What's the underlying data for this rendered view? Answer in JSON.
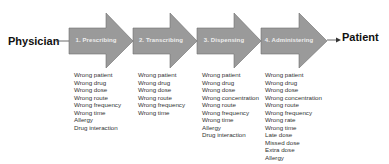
{
  "diagram": {
    "source": "Physician",
    "target": "Patient",
    "colors": {
      "arrow_fill": "#9a9a9a",
      "arrow_stroke": "#6e6e6e",
      "label_text": "#eeeeee",
      "connector": "#444444"
    },
    "stages": [
      {
        "label": "1. Prescribing",
        "errors": [
          "Wrong patient",
          "Wrong drug",
          "Wrong dose",
          "Wrong route",
          "Wrong frequency",
          "Wrong time",
          "Allergy",
          "Drug interaction"
        ]
      },
      {
        "label": "2. Transcribing",
        "errors": [
          "Wrong patient",
          "Wrong drug",
          "Wrong dose",
          "Wrong route",
          "Wrong frequency",
          "Wrong time"
        ]
      },
      {
        "label": "3. Dispensing",
        "errors": [
          "Wrong patient",
          "Wrong drug",
          "Wrong dose",
          "Wrong concentration",
          "Wrong route",
          "Wrong frequency",
          "Wrong time",
          "Allergy",
          "Drug interaction"
        ]
      },
      {
        "label": "4. Administering",
        "errors": [
          "Wrong patient",
          "Wrong drug",
          "Wrong dose",
          "Wrong concentration",
          "Wrong route",
          "Wrong frequency",
          "Wrong rate",
          "Wrong time",
          "Late dose",
          "Missed dose",
          "Extra dose",
          "Allergy"
        ]
      }
    ]
  }
}
